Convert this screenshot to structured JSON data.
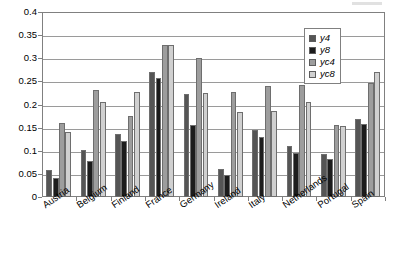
{
  "chart_data": {
    "type": "bar",
    "title": "",
    "subtitle": "",
    "xlabel": "",
    "ylabel": "",
    "ylim": [
      0,
      0.4
    ],
    "ytick_labels": [
      "0",
      "0.05",
      "0.1",
      "0.15",
      "0.2",
      "0.25",
      "0.3",
      "0.35",
      "0.4"
    ],
    "ytick_values": [
      0,
      0.05,
      0.1,
      0.15,
      0.2,
      0.25,
      0.3,
      0.35,
      0.4
    ],
    "grid": true,
    "legend_position": "top-right",
    "categories": [
      "Austria",
      "Belgium",
      "Finland",
      "France",
      "Germany",
      "Ireland",
      "Italy",
      "Netherlands",
      "Portugal",
      "Spain"
    ],
    "series": [
      {
        "name": "y4",
        "color": "#555555",
        "values": [
          0.058,
          0.102,
          0.136,
          0.271,
          0.222,
          0.06,
          0.145,
          0.11,
          0.093,
          0.168
        ]
      },
      {
        "name": "y8",
        "color": "#1c1c1c",
        "values": [
          0.042,
          0.078,
          0.121,
          0.257,
          0.155,
          0.048,
          0.13,
          0.095,
          0.082,
          0.158
        ]
      },
      {
        "name": "yc4",
        "color": "#9d9d9d",
        "values": [
          0.161,
          0.232,
          0.176,
          0.329,
          0.301,
          0.228,
          0.24,
          0.243,
          0.155,
          0.247
        ]
      },
      {
        "name": "yc8",
        "color": "#d0d0d0",
        "values": [
          0.141,
          0.206,
          0.228,
          0.329,
          0.224,
          0.183,
          0.186,
          0.206,
          0.154,
          0.27
        ]
      }
    ]
  },
  "legend": {
    "items": [
      {
        "label": "y4"
      },
      {
        "label": "y8"
      },
      {
        "label": "yc4"
      },
      {
        "label": "yc8"
      }
    ]
  }
}
